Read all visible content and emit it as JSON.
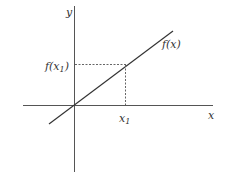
{
  "diagram": {
    "axes": {
      "x_label": "x",
      "y_label": "y"
    },
    "curve": {
      "label": "f(x)"
    },
    "point": {
      "x_label": "x",
      "x_sub": "1",
      "y_label_pre": "f(x",
      "y_sub": "1",
      "y_label_post": ")"
    },
    "colors": {
      "line": "#333333",
      "axis": "#444444",
      "dash": "#555555"
    }
  }
}
